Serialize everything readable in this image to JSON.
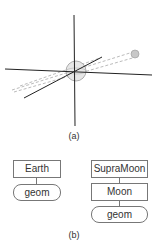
{
  "figure_a": {
    "caption": "(a)",
    "elements": [
      "vertical-axis",
      "horizontal-axis",
      "diagonal-axis",
      "earth-sphere",
      "moon-sphere",
      "orbit-dashed-lines"
    ]
  },
  "figure_b": {
    "caption": "(b)",
    "left_tree": {
      "root": "Earth",
      "child": "geom"
    },
    "right_tree": {
      "root": "SupraMoon",
      "middle": "Moon",
      "child": "geom"
    }
  },
  "colors": {
    "axis": "#222222",
    "sphere": "#bbbbbb",
    "dashed": "#aaaaaa",
    "box_border": "#777777"
  }
}
